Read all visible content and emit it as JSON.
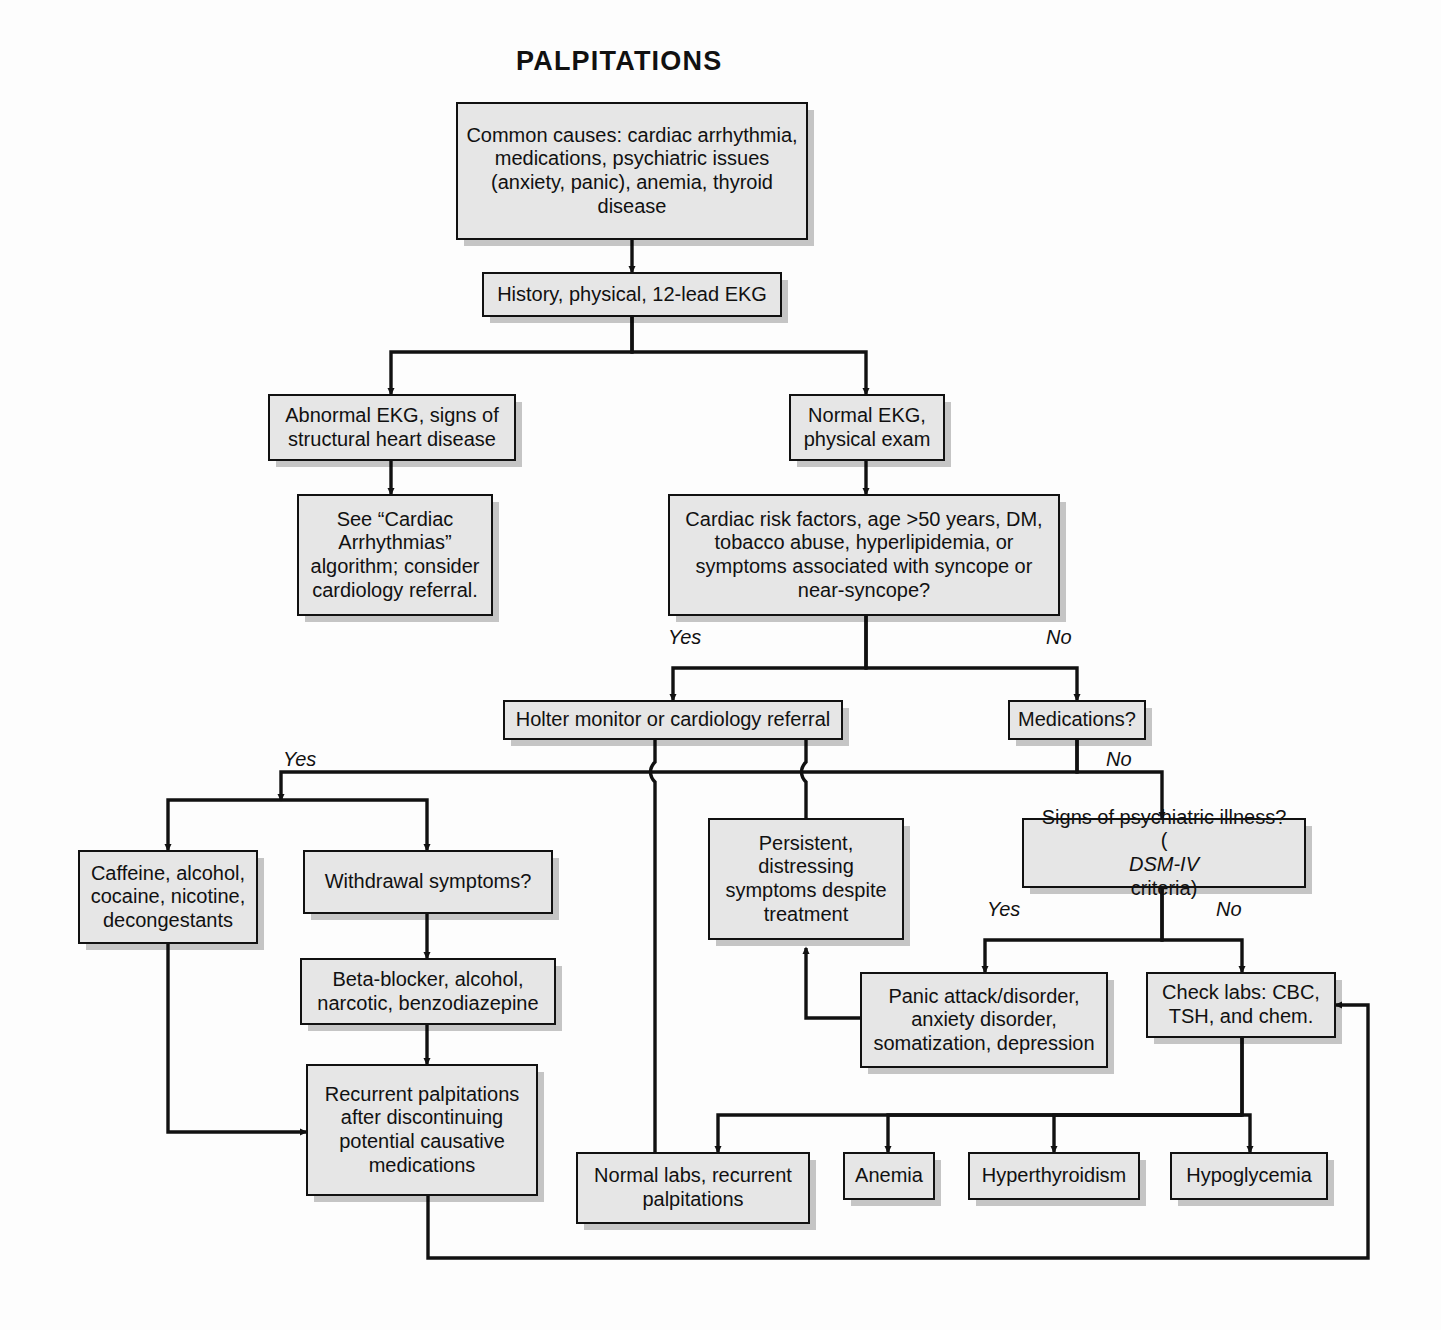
{
  "title": "PALPITATIONS",
  "colors": {
    "node_fill": "#e6e6e6",
    "node_border": "#111111",
    "line": "#111111",
    "background": "#ffffff"
  },
  "nodes": {
    "common_causes": "Common causes: cardiac arrhythmia, medications, psychiatric issues (anxiety, panic), anemia, thyroid disease",
    "history": "History, physical, 12-lead EKG",
    "abnormal_ekg": "Abnormal EKG, signs of structural heart disease",
    "normal_ekg": "Normal EKG, physical exam",
    "see_cardiac": "See “Cardiac Arrhythmias” algorithm; consider cardiology referral.",
    "risk_factors": "Cardiac risk factors, age >50 years, DM, tobacco abuse, hyperlipidemia, or symptoms associated with syncope or near-syncope?",
    "holter": "Holter monitor or cardiology referral",
    "medications": "Medications?",
    "caffeine": "Caffeine, alcohol, cocaine, nicotine, decongestants",
    "withdrawal": "Withdrawal symptoms?",
    "beta_blocker": "Beta-blocker, alcohol, narcotic, benzodiazepine",
    "recurrent": "Recurrent palpitations after discontinuing potential causative medications",
    "persistent": "Persistent, distressing symptoms despite treatment",
    "psychiatric_pre": "Signs of psychiatric illness?",
    "psychiatric_em": "DSM-IV",
    "psychiatric_post": " criteria)",
    "psychiatric_paren": "(",
    "panic": "Panic attack/disorder, anxiety disorder, somatization, depression",
    "check_labs": "Check labs: CBC, TSH, and chem.",
    "normal_labs": "Normal labs, recurrent palpitations",
    "anemia": "Anemia",
    "hyperthyroidism": "Hyperthyroidism",
    "hypoglycemia": "Hypoglycemia"
  },
  "edge_labels": {
    "risk_yes": "Yes",
    "risk_no": "No",
    "meds_yes": "Yes",
    "meds_no": "No",
    "psych_yes": "Yes",
    "psych_no": "No"
  }
}
